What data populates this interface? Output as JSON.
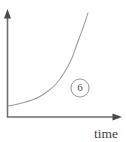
{
  "figure": {
    "title": "",
    "background_color": "#ffffff",
    "axis_color": "#6f6f6f",
    "curve_color": "#9a9a9a",
    "label_color": "#3f3f3f",
    "x_axis_label": "time",
    "y_axis_label": "",
    "callout_label": "6",
    "callout_icon": "circled-number-icon",
    "y_axis_arrow_icon": "arrow-up-icon",
    "x_axis_arrow_icon": "arrow-right-icon"
  },
  "chart_data": {
    "type": "line",
    "title": "",
    "xlabel": "time",
    "ylabel": "",
    "grid": false,
    "legend": null,
    "annotations": [
      {
        "text": "6",
        "shape": "circle",
        "x": 80,
        "y": 88
      }
    ],
    "xlim": [
      0,
      126
    ],
    "ylim": [
      0,
      142
    ],
    "series": [
      {
        "name": "exponential-growth",
        "x": [
          8,
          16,
          24,
          32,
          40,
          48,
          54,
          60,
          64,
          68,
          72,
          76,
          80,
          84,
          88
        ],
        "y": [
          106,
          104.5,
          102.5,
          100,
          96.5,
          91,
          86,
          79,
          73,
          66,
          58,
          47,
          36,
          25,
          13
        ]
      }
    ],
    "xticks": [],
    "yticks": [],
    "xticklabels": [],
    "yticklabels": []
  }
}
